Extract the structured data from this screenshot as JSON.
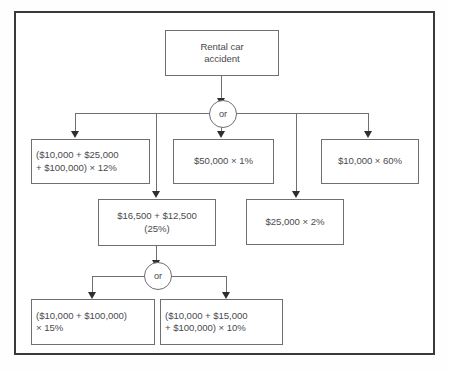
{
  "diagram": {
    "root": {
      "label": "Rental car\naccident"
    },
    "gates": [
      {
        "id": "gate-1",
        "label": "or"
      },
      {
        "id": "gate-2",
        "label": "or"
      }
    ],
    "nodes": [
      {
        "id": "node-left-12pct",
        "label": "($10,000 + $25,000\n+ $100,000) × 12%"
      },
      {
        "id": "node-mid-50000-1pct",
        "label": "$50,000 × 1%"
      },
      {
        "id": "node-right-10000-60pct",
        "label": "$10,000 × 60%"
      },
      {
        "id": "node-16500-12500",
        "label": "$16,500 + $12,500\n(25%)"
      },
      {
        "id": "node-25000-2pct",
        "label": "$25,000 × 2%"
      },
      {
        "id": "node-bottom-left-15pct",
        "label": "($10,000 + $100,000)\n× 15%"
      },
      {
        "id": "node-bottom-right-10pct",
        "label": "($10,000 + $15,000\n+ $100,000) × 10%"
      }
    ],
    "colors": {
      "frame_border": "#3a3a3e",
      "box_border": "#6e6e73",
      "line": "#6e6e73",
      "arrow": "#2e2e33",
      "text": "#4a4a4f",
      "background": "#ffffff"
    }
  }
}
